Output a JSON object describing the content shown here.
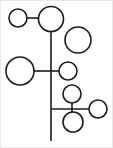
{
  "canvas": {
    "width": 113,
    "height": 148,
    "background_color": "#ffffff",
    "border_color": "#e9e9e9",
    "title": "Node and branch diagram"
  },
  "style": {
    "stroke_color": "#1c1c1c",
    "node_fill_color": "#ffffff",
    "stroke_width": 1.6
  },
  "chart_data": {
    "type": "diagram",
    "title": "Node and branch diagram",
    "description": "Black outlined circles of varying size connected by straight line segments to a central vertical trunk, resembling a stylized plant or tree graph.",
    "nodes": [
      {
        "id": "n1",
        "label": "",
        "cx": 17,
        "cy": 17,
        "r": 9,
        "size": "small"
      },
      {
        "id": "n2",
        "label": "",
        "cx": 50,
        "cy": 18,
        "r": 12.5,
        "size": "large"
      },
      {
        "id": "n3",
        "label": "",
        "cx": 77,
        "cy": 39,
        "r": 13,
        "size": "large"
      },
      {
        "id": "n4",
        "label": "",
        "cx": 19,
        "cy": 70,
        "r": 14,
        "size": "large"
      },
      {
        "id": "n5",
        "label": "",
        "cx": 67,
        "cy": 70,
        "r": 9,
        "size": "small"
      },
      {
        "id": "n6",
        "label": "",
        "cx": 71,
        "cy": 93,
        "r": 9,
        "size": "small"
      },
      {
        "id": "n7",
        "label": "",
        "cx": 72,
        "cy": 121,
        "r": 10,
        "size": "small"
      },
      {
        "id": "n8",
        "label": "",
        "cx": 97,
        "cy": 108,
        "r": 9,
        "size": "small"
      }
    ],
    "edges": [
      {
        "id": "e1",
        "label": "trunk",
        "x1": 50,
        "y1": 30,
        "x2": 50,
        "y2": 140
      },
      {
        "id": "e2",
        "label": "top-branch",
        "x1": 26,
        "y1": 17,
        "x2": 37,
        "y2": 17
      },
      {
        "id": "e3",
        "label": "mid-branch",
        "x1": 33,
        "y1": 70,
        "x2": 58,
        "y2": 70
      },
      {
        "id": "e4",
        "label": "lower-branch",
        "x1": 50,
        "y1": 108,
        "x2": 88,
        "y2": 108
      },
      {
        "id": "e5",
        "label": "cluster-stem",
        "x1": 71,
        "y1": 102,
        "x2": 71,
        "y2": 112
      }
    ],
    "node_count": 8,
    "edge_count": 5,
    "xlim": [
      0,
      113
    ],
    "ylim": [
      0,
      148
    ],
    "grid": false,
    "legend": false
  }
}
